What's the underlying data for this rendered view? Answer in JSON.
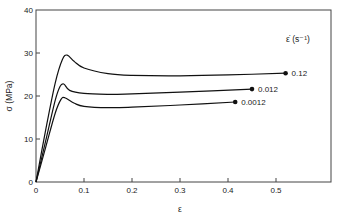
{
  "chart_data": {
    "type": "line",
    "title": "",
    "xlabel": "ε",
    "ylabel": "σ (MPa)",
    "xlim": [
      0,
      0.615
    ],
    "ylim": [
      0,
      40
    ],
    "xticks": [
      0,
      0.1,
      0.2,
      0.3,
      0.4,
      0.5
    ],
    "xtick_labels": [
      "0",
      "0.1",
      "0.2",
      "0.3",
      "0.4",
      "0.5"
    ],
    "yticks": [
      0,
      10,
      20,
      30,
      40
    ],
    "ytick_labels": [
      "0",
      "10",
      "20",
      "30",
      "40"
    ],
    "grid": false,
    "legend_title": "ε̇ (s⁻¹)",
    "legend_position": "inline-right",
    "series": [
      {
        "name": "0.12",
        "x": [
          0,
          0.02,
          0.04,
          0.055,
          0.065,
          0.08,
          0.1,
          0.15,
          0.2,
          0.3,
          0.4,
          0.52
        ],
        "y": [
          0,
          12,
          23,
          28.5,
          29.5,
          28,
          26.5,
          25.2,
          24.8,
          24.7,
          24.9,
          25.3
        ],
        "end_marker": true
      },
      {
        "name": "0.012",
        "x": [
          0,
          0.02,
          0.04,
          0.05,
          0.058,
          0.07,
          0.1,
          0.15,
          0.2,
          0.3,
          0.45
        ],
        "y": [
          0,
          9.5,
          19,
          22.2,
          22.8,
          21.3,
          20.6,
          20.4,
          20.5,
          20.9,
          21.6
        ],
        "end_marker": true
      },
      {
        "name": "0.0012",
        "x": [
          0,
          0.02,
          0.04,
          0.052,
          0.06,
          0.08,
          0.1,
          0.15,
          0.2,
          0.3,
          0.415
        ],
        "y": [
          0,
          8,
          16,
          19.2,
          19.6,
          18.3,
          17.6,
          17.3,
          17.4,
          17.9,
          18.6
        ],
        "end_marker": true
      }
    ]
  }
}
